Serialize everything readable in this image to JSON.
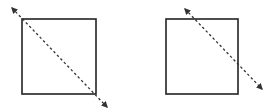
{
  "diagram": {
    "background": "#ffffff",
    "stroke_color": "#222222",
    "arrow_color": "#333333",
    "panels": [
      {
        "name": "left",
        "square": {
          "x": 22,
          "y": 19,
          "w": 74,
          "h": 75
        },
        "line": {
          "x1": 12,
          "y1": 8,
          "x2": 107,
          "y2": 107,
          "style": "dashed",
          "arrowheads": "both"
        },
        "relation": "diagonal through opposite corners"
      },
      {
        "name": "right",
        "square": {
          "x": 166,
          "y": 19,
          "w": 72,
          "h": 75
        },
        "line": {
          "x1": 185,
          "y1": 9,
          "x2": 262,
          "y2": 89,
          "style": "dashed",
          "arrowheads": "both"
        },
        "relation": "line crossing top edge and right edge"
      }
    ]
  }
}
